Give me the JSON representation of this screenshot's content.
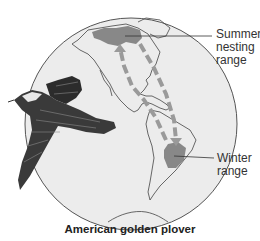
{
  "figure": {
    "title": "American golden plover",
    "labels": {
      "summer": [
        "Summer",
        "nesting",
        "range"
      ],
      "winter": [
        "Winter",
        "range"
      ]
    },
    "icons": {
      "globe": "globe-icon",
      "bird": "bird-icon",
      "migration_arrows": "arrow-icon"
    },
    "colors": {
      "background": "#ffffff",
      "globe_fill": "#ececec",
      "outline": "#555555",
      "range_fill": "#888888",
      "arrow_fill": "#9a9a9a",
      "text": "#333333"
    }
  }
}
